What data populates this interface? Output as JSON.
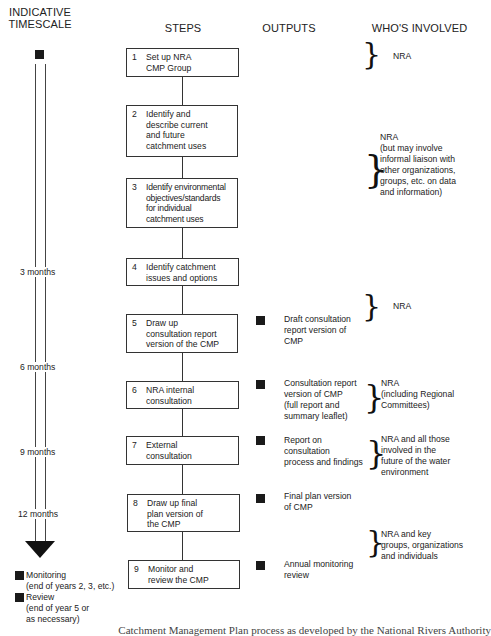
{
  "headers": {
    "timescale": "INDICATIVE\nTIMESCALE",
    "steps": "STEPS",
    "outputs": "OUTPUTS",
    "whos_involved": "WHO'S INVOLVED"
  },
  "steps": [
    {
      "number": "1",
      "text": "Set up NRA\nCMP Group"
    },
    {
      "number": "2",
      "text": "Identify and\ndescribe current\nand future\ncatchment uses"
    },
    {
      "number": "3",
      "text": "Identify environmental\nobjectives/standards\nfor individual\ncatchment uses"
    },
    {
      "number": "4",
      "text": "Identify catchment\nissues and options"
    },
    {
      "number": "5",
      "text": "Draw up\nconsultation report\nversion of the CMP"
    },
    {
      "number": "6",
      "text": "NRA internal\nconsultation"
    },
    {
      "number": "7",
      "text": "External\nconsultation"
    },
    {
      "number": "8",
      "text": "Draw up final\nplan version of\nthe CMP"
    },
    {
      "number": "9",
      "text": "Monitor and\nreview the CMP"
    }
  ],
  "outputs": [
    {
      "step": "5",
      "text": "Draft consultation\nreport version of\nCMP"
    },
    {
      "step": "6",
      "text": "Consultation report\nversion of CMP\n(full report and\nsummary leaflet)"
    },
    {
      "step": "7",
      "text": "Report on\nconsultation\nprocess and findings"
    },
    {
      "step": "8",
      "text": "Final plan version\nof CMP"
    },
    {
      "step": "9",
      "text": "Annual monitoring\nreview"
    }
  ],
  "involved": [
    {
      "steps": "1",
      "text": "NRA"
    },
    {
      "steps": "2-3",
      "text": "NRA\n(but may involve\ninformal liaison with\nother organizations,\ngroups, etc. on data\nand information)"
    },
    {
      "steps": "4-5",
      "text": "NRA"
    },
    {
      "steps": "6",
      "text": "NRA\n(including Regional\nCommittees)"
    },
    {
      "steps": "7",
      "text": "NRA and all those\ninvolved in the\nfuture of the water\nenvironment"
    },
    {
      "steps": "8-9",
      "text": "NRA and key\ngroups, organizations\nand individuals"
    }
  ],
  "timescale": {
    "marks": [
      "3 months",
      "6 months",
      "9 months",
      "12 months"
    ],
    "legend": [
      {
        "icon": "filled-square",
        "label": "Monitoring\n(end of years 2, 3, etc.)"
      },
      {
        "icon": "filled-square",
        "label": "Review\n(end of year 5 or\nas necessary)"
      }
    ]
  },
  "caption": "Catchment Management Plan process as developed by the National Rivers Authority"
}
